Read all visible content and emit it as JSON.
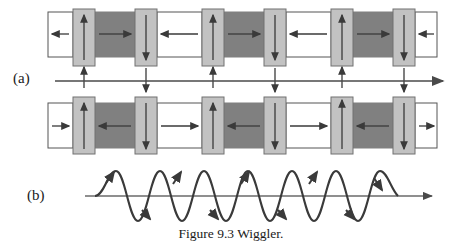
{
  "figure": {
    "caption": "Figure 9.3 Wiggler.",
    "panels": [
      {
        "key": "a",
        "label": "(a)",
        "description": "magnet arrays with alternating field"
      },
      {
        "key": "b",
        "label": "(b)",
        "description": "electron sinusoidal trajectory"
      }
    ]
  },
  "colors": {
    "white_block": "#ffffff",
    "light_block": "#c2c2c2",
    "dark_block": "#808080",
    "outline": "#555555",
    "arrow": "#3a3a3a",
    "axis": "#4a4a4a",
    "wave": "#3a3a3a",
    "text": "#1a1a1a"
  },
  "geometry": {
    "period": 110,
    "row_top": {
      "x": 48,
      "y": 12,
      "width": 389,
      "height": 45
    },
    "row_bottom": {
      "x": 48,
      "y": 103,
      "width": 389,
      "height": 45
    },
    "tall_block_overhang": 9,
    "axis_a": {
      "x1": 55,
      "x2": 443,
      "y": 81
    },
    "axis_b": {
      "x1": 85,
      "x2": 432,
      "y": 196
    },
    "wave": {
      "x_start": 95,
      "x_end": 398,
      "amplitude": 25,
      "cycles": 4.5
    }
  },
  "panel_a": {
    "top_row": {
      "blocks": [
        {
          "type": "white",
          "arrow": "left",
          "x": 48,
          "width": 25
        },
        {
          "type": "light",
          "arrow": "up",
          "x": 73,
          "width": 22
        },
        {
          "type": "dark",
          "arrow": "right",
          "x": 95,
          "width": 40
        },
        {
          "type": "light",
          "arrow": "down",
          "x": 135,
          "width": 22
        },
        {
          "type": "white",
          "arrow": "left",
          "x": 157,
          "width": 45
        },
        {
          "type": "light",
          "arrow": "up",
          "x": 202,
          "width": 22
        },
        {
          "type": "dark",
          "arrow": "right",
          "x": 224,
          "width": 40
        },
        {
          "type": "light",
          "arrow": "down",
          "x": 264,
          "width": 22
        },
        {
          "type": "white",
          "arrow": "left",
          "x": 286,
          "width": 45
        },
        {
          "type": "light",
          "arrow": "up",
          "x": 331,
          "width": 22
        },
        {
          "type": "dark",
          "arrow": "right",
          "x": 353,
          "width": 40
        },
        {
          "type": "light",
          "arrow": "down",
          "x": 393,
          "width": 22
        },
        {
          "type": "white",
          "arrow": "left",
          "x": 415,
          "width": 22
        }
      ]
    },
    "bottom_row": {
      "blocks": [
        {
          "type": "white",
          "arrow": "right",
          "x": 48,
          "width": 25
        },
        {
          "type": "light",
          "arrow": "up",
          "x": 73,
          "width": 22
        },
        {
          "type": "dark",
          "arrow": "left",
          "x": 95,
          "width": 40
        },
        {
          "type": "light",
          "arrow": "down",
          "x": 135,
          "width": 22
        },
        {
          "type": "white",
          "arrow": "right",
          "x": 157,
          "width": 45
        },
        {
          "type": "light",
          "arrow": "up",
          "x": 202,
          "width": 22
        },
        {
          "type": "dark",
          "arrow": "left",
          "x": 224,
          "width": 40
        },
        {
          "type": "light",
          "arrow": "down",
          "x": 264,
          "width": 22
        },
        {
          "type": "white",
          "arrow": "right",
          "x": 286,
          "width": 45
        },
        {
          "type": "light",
          "arrow": "up",
          "x": 331,
          "width": 22
        },
        {
          "type": "dark",
          "arrow": "left",
          "x": 353,
          "width": 40
        },
        {
          "type": "light",
          "arrow": "down",
          "x": 393,
          "width": 22
        },
        {
          "type": "white",
          "arrow": "right",
          "x": 415,
          "width": 22
        }
      ]
    },
    "field_arrows": [
      {
        "x": 84,
        "direction": "up"
      },
      {
        "x": 146,
        "direction": "down"
      },
      {
        "x": 213,
        "direction": "up"
      },
      {
        "x": 275,
        "direction": "down"
      },
      {
        "x": 342,
        "direction": "up"
      },
      {
        "x": 404,
        "direction": "down"
      }
    ]
  },
  "panel_b": {
    "wave_arrows": [
      {
        "x": 113,
        "direction": "up-right"
      },
      {
        "x": 150,
        "direction": "down-right"
      },
      {
        "x": 181,
        "direction": "up-right"
      },
      {
        "x": 218,
        "direction": "down-right"
      },
      {
        "x": 249,
        "direction": "up-right"
      },
      {
        "x": 286,
        "direction": "down-right"
      },
      {
        "x": 317,
        "direction": "up-right"
      },
      {
        "x": 354,
        "direction": "down-right"
      }
    ]
  }
}
